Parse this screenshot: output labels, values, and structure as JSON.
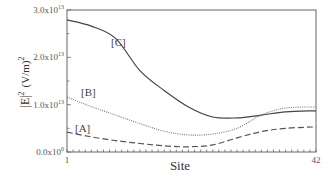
{
  "chart_data": {
    "type": "line",
    "title": "",
    "xlabel": "Site",
    "ylabel": "|E|² (V/m)²",
    "xlim": [
      1,
      42
    ],
    "ylim": [
      0,
      30000000000000.0
    ],
    "grid": false,
    "legend": "inline labels near left end of curves",
    "x_tick_labels": [
      "1",
      "42"
    ],
    "y_tick_labels": [
      "0.0x10^0",
      "1.0x10^13",
      "2.0x10^13",
      "3.0x10^13"
    ],
    "x": [
      1,
      5,
      9,
      13,
      17,
      21,
      25,
      29,
      33,
      37,
      42
    ],
    "series": [
      {
        "name": "[A]",
        "style": "dashed",
        "values": [
          4200000000000.0,
          3200000000000.0,
          2400000000000.0,
          1800000000000.0,
          1300000000000.0,
          1100000000000.0,
          1500000000000.0,
          3000000000000.0,
          4300000000000.0,
          5000000000000.0,
          5300000000000.0
        ]
      },
      {
        "name": "[B]",
        "style": "dotted",
        "values": [
          11600000000000.0,
          9600000000000.0,
          7800000000000.0,
          6000000000000.0,
          4400000000000.0,
          3600000000000.0,
          3800000000000.0,
          5000000000000.0,
          7800000000000.0,
          9300000000000.0,
          9500000000000.0
        ]
      },
      {
        "name": "[C]",
        "style": "solid",
        "values": [
          27900000000000.0,
          26600000000000.0,
          24000000000000.0,
          17200000000000.0,
          13000000000000.0,
          9500000000000.0,
          7400000000000.0,
          7200000000000.0,
          7800000000000.0,
          8500000000000.0,
          8700000000000.0
        ]
      }
    ]
  },
  "axes": {
    "x_title": "Site",
    "y_title_main": "|E|",
    "y_title_sup": "2",
    "y_title_unit": "(V/m)",
    "y_title_unit_sup": "2",
    "x_ticks": {
      "first": "1",
      "last": "42"
    },
    "y_ticks": [
      {
        "mantissa": "0.0x10",
        "exp": "0"
      },
      {
        "mantissa": "1.0x10",
        "exp": "13"
      },
      {
        "mantissa": "2.0x10",
        "exp": "13"
      },
      {
        "mantissa": "3.0x10",
        "exp": "13"
      }
    ]
  },
  "labels": {
    "a": "[A]",
    "b": "[B]",
    "c": "[C]"
  },
  "colors": {
    "axis": "#555555",
    "curve_c": "#444444",
    "curve_b": "#777777",
    "curve_a": "#555555"
  }
}
